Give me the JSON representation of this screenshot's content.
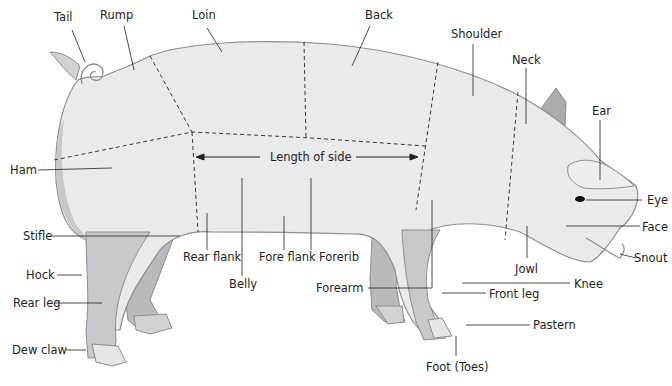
{
  "diagram": {
    "colors": {
      "body_fill": "#e9eaec",
      "body_shade": "#d8d9dc",
      "outline": "#8c8e92",
      "leg_fill": "#c6c8cc",
      "leg_far": "#b8babe",
      "hoof": "#e4e5e7",
      "ear_far": "#a9abaf",
      "leader": "#231f20",
      "dash": "#3a3a3a"
    },
    "labels": {
      "tail": "Tail",
      "rump": "Rump",
      "loin": "Loin",
      "back": "Back",
      "shoulder": "Shoulder",
      "neck": "Neck",
      "ear": "Ear",
      "eye": "Eye",
      "face": "Face",
      "snout": "Snout",
      "ham": "Ham",
      "length_of_side": "Length of side",
      "stifle": "Stifle",
      "hock": "Hock",
      "rear_leg": "Rear leg",
      "dew_claw": "Dew claw",
      "rear_flank": "Rear flank",
      "belly": "Belly",
      "fore_flank": "Fore flank",
      "forerib": "Forerib",
      "forearm": "Forearm",
      "jowl": "Jowl",
      "knee": "Knee",
      "front_leg": "Front leg",
      "pastern": "Pastern",
      "foot": "Foot (Toes)"
    }
  }
}
